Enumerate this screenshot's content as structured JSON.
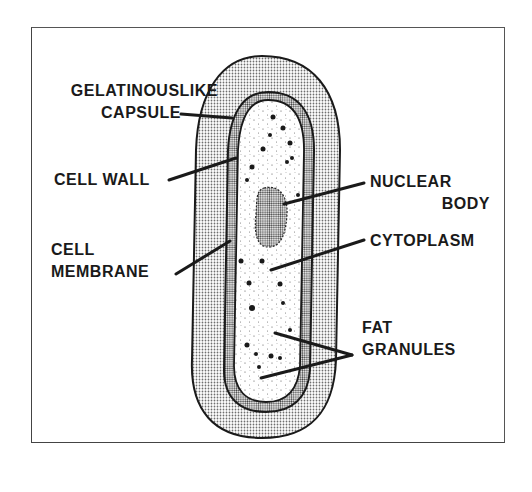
{
  "diagram": {
    "labels": {
      "capsule_line1": "GELATINOUSLIKE",
      "capsule_line2": "CAPSULE",
      "cell_wall": "CELL WALL",
      "membrane_line1": "CELL",
      "membrane_line2": "MEMBRANE",
      "nuclear_line1": "NUCLEAR",
      "nuclear_line2": "BODY",
      "cytoplasm": "CYTOPLASM",
      "fat_line1": "FAT",
      "fat_line2": "GRANULES"
    },
    "colors": {
      "ink": "#1a1a1a",
      "background": "#ffffff",
      "stipple": "#b8b8b8"
    }
  }
}
